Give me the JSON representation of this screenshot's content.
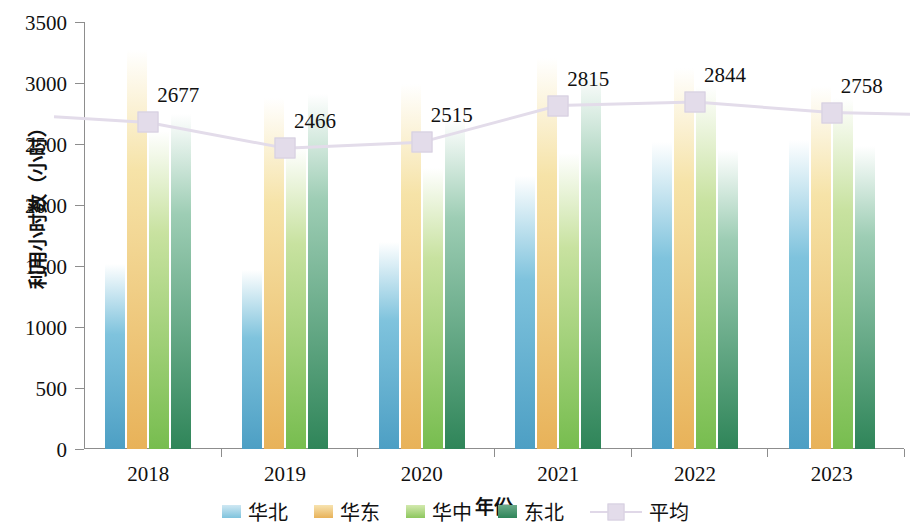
{
  "chart_data": {
    "type": "bar",
    "title": "",
    "xlabel": "年份",
    "ylabel": "利用小时数（小时）",
    "categories": [
      "2018",
      "2019",
      "2020",
      "2021",
      "2022",
      "2023"
    ],
    "ylim": [
      0,
      3500
    ],
    "ytick_labels": [
      "0",
      "500",
      "1000",
      "1500",
      "2000",
      "2500",
      "3000",
      "3500"
    ],
    "ytick_values": [
      0,
      500,
      1000,
      1500,
      2000,
      2500,
      3000,
      3500
    ],
    "grid": false,
    "legend_position": "bottom",
    "series": [
      {
        "name": "华北",
        "key": "huabei",
        "color": "#7fc3dd",
        "values": [
          1517,
          1465,
          1700,
          2237,
          2520,
          2537
        ]
      },
      {
        "name": "华东",
        "key": "huadong",
        "color": "#e8b259",
        "values": [
          3272,
          2878,
          2990,
          3203,
          3120,
          2973
        ]
      },
      {
        "name": "华中",
        "key": "huazhong",
        "color": "#8dc75e",
        "values": [
          2610,
          2477,
          2300,
          2423,
          2977,
          2877
        ]
      },
      {
        "name": "东北",
        "key": "dongbei",
        "color": "#2f8559",
        "values": [
          2750,
          2910,
          2700,
          3092,
          2447,
          2487
        ]
      }
    ],
    "average_line": {
      "name": "平均",
      "color": "#e3dcea",
      "values": [
        2677,
        2466,
        2515,
        2815,
        2844,
        2758
      ],
      "labels": [
        "2677",
        "2466",
        "2515",
        "2815",
        "2844",
        "2758"
      ]
    }
  },
  "legend": {
    "items": [
      {
        "label": "华北",
        "kind": "bar",
        "swatch_class": "sw-huabei"
      },
      {
        "label": "华东",
        "kind": "bar",
        "swatch_class": "sw-huadong"
      },
      {
        "label": "华中",
        "kind": "bar",
        "swatch_class": "sw-huazhong"
      },
      {
        "label": "东北",
        "kind": "bar",
        "swatch_class": "sw-dongbei"
      },
      {
        "label": "平均",
        "kind": "line",
        "swatch_class": ""
      }
    ]
  }
}
